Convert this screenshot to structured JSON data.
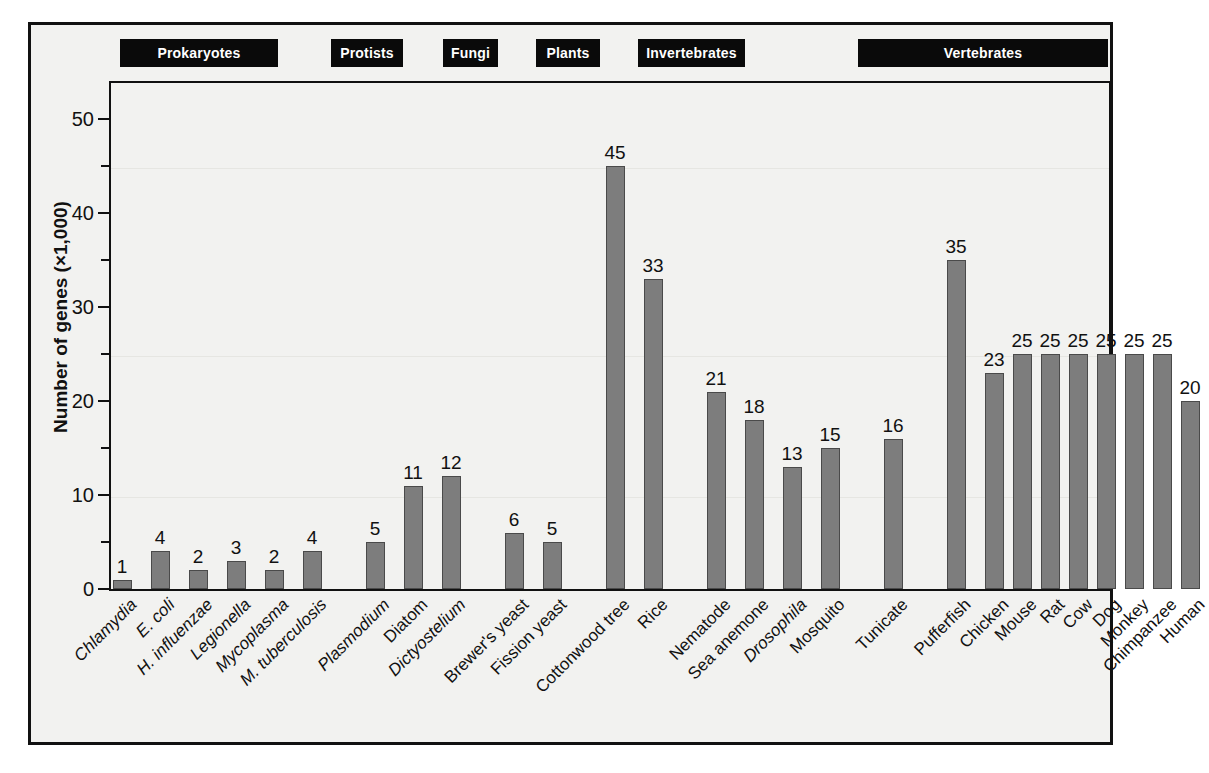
{
  "chart_data": {
    "type": "bar",
    "title": "",
    "xlabel": "",
    "ylabel": "Number of genes (×1,000)",
    "ylim": [
      0,
      55
    ],
    "yticks_major": [
      0,
      10,
      20,
      30,
      40,
      50
    ],
    "yticks_minor": [
      5,
      15,
      25,
      35,
      45
    ],
    "grid": false,
    "legend": "none",
    "groups": [
      {
        "name": "Prokaryotes",
        "categories": [
          "Chlamydia",
          "E. coli",
          "H. influenzae",
          "Legionella",
          "Mycoplasma",
          "M. tuberculosis"
        ],
        "italic": [
          true,
          true,
          true,
          true,
          true,
          true
        ],
        "values": [
          1,
          4,
          2,
          3,
          2,
          4
        ]
      },
      {
        "name": "Protists",
        "categories": [
          "Plasmodium",
          "Diatom",
          "Dictyostelium"
        ],
        "italic": [
          true,
          false,
          true
        ],
        "values": [
          5,
          11,
          12
        ]
      },
      {
        "name": "Fungi",
        "categories": [
          "Brewer's yeast",
          "Fission yeast"
        ],
        "italic": [
          false,
          false
        ],
        "values": [
          6,
          5
        ]
      },
      {
        "name": "Plants",
        "categories": [
          "Cottonwood tree",
          "Rice"
        ],
        "italic": [
          false,
          false
        ],
        "values": [
          45,
          33
        ]
      },
      {
        "name": "Invertebrates",
        "categories": [
          "Nematode",
          "Sea anemone",
          "Drosophila",
          "Mosquito"
        ],
        "italic": [
          false,
          false,
          true,
          false
        ],
        "values": [
          21,
          18,
          13,
          15
        ]
      },
      {
        "name": "",
        "categories": [
          "Tunicate"
        ],
        "italic": [
          false
        ],
        "values": [
          16
        ]
      },
      {
        "name": "Vertebrates",
        "categories": [
          "Pufferfish",
          "Chicken",
          "Mouse",
          "Rat",
          "Cow",
          "Dog",
          "Monkey",
          "Chimpanzee",
          "Human"
        ],
        "italic": [
          false,
          false,
          false,
          false,
          false,
          false,
          false,
          false,
          false
        ],
        "values": [
          35,
          23,
          25,
          25,
          25,
          25,
          25,
          25,
          20
        ]
      }
    ],
    "colors": {
      "bar_fill": "#7d7d7d",
      "bar_edge": "#4a4a4a",
      "axis": "#111111",
      "background": "#f2f2f0",
      "group_header_bg": "#0a0a0a",
      "group_header_text": "#ffffff"
    }
  },
  "group_headers": [
    {
      "label": "Prokaryotes",
      "left": 89,
      "width": 158
    },
    {
      "label": "Protists",
      "left": 300,
      "width": 72
    },
    {
      "label": "Fungi",
      "left": 412,
      "width": 55
    },
    {
      "label": "Plants",
      "left": 505,
      "width": 64
    },
    {
      "label": "Invertebrates",
      "left": 607,
      "width": 107
    },
    {
      "label": "Vertebrates",
      "left": 827,
      "width": 250
    }
  ],
  "bars": [
    {
      "label": "Chlamydia",
      "value": 1,
      "x": 11,
      "italic": true
    },
    {
      "label": "E. coli",
      "value": 4,
      "x": 49,
      "italic": true
    },
    {
      "label": "H. influenzae",
      "value": 2,
      "x": 87,
      "italic": true
    },
    {
      "label": "Legionella",
      "value": 3,
      "x": 125,
      "italic": true
    },
    {
      "label": "Mycoplasma",
      "value": 2,
      "x": 163,
      "italic": true
    },
    {
      "label": "M. tuberculosis",
      "value": 4,
      "x": 201,
      "italic": true
    },
    {
      "label": "Plasmodium",
      "value": 5,
      "x": 264,
      "italic": true
    },
    {
      "label": "Diatom",
      "value": 11,
      "x": 302,
      "italic": false
    },
    {
      "label": "Dictyostelium",
      "value": 12,
      "x": 340,
      "italic": true
    },
    {
      "label": "Brewer's yeast",
      "value": 6,
      "x": 403,
      "italic": false
    },
    {
      "label": "Fission yeast",
      "value": 5,
      "x": 441,
      "italic": false
    },
    {
      "label": "Cottonwood tree",
      "value": 45,
      "x": 504,
      "italic": false
    },
    {
      "label": "Rice",
      "value": 33,
      "x": 542,
      "italic": false
    },
    {
      "label": "Nematode",
      "value": 21,
      "x": 605,
      "italic": false
    },
    {
      "label": "Sea anemone",
      "value": 18,
      "x": 643,
      "italic": false
    },
    {
      "label": "Drosophila",
      "value": 13,
      "x": 681,
      "italic": true
    },
    {
      "label": "Mosquito",
      "value": 15,
      "x": 719,
      "italic": false
    },
    {
      "label": "Tunicate",
      "value": 16,
      "x": 782,
      "italic": false
    },
    {
      "label": "Pufferfish",
      "value": 35,
      "x": 845,
      "italic": false
    },
    {
      "label": "Chicken",
      "value": 23,
      "x": 883,
      "italic": false
    },
    {
      "label": "Mouse",
      "value": 25,
      "x": 911,
      "italic": false
    },
    {
      "label": "Rat",
      "value": 25,
      "x": 939,
      "italic": false
    },
    {
      "label": "Cow",
      "value": 25,
      "x": 967,
      "italic": false
    },
    {
      "label": "Dog",
      "value": 25,
      "x": 995,
      "italic": false
    },
    {
      "label": "Monkey",
      "value": 25,
      "x": 1023,
      "italic": false
    },
    {
      "label": "Chimpanzee",
      "value": 25,
      "x": 1051,
      "italic": false
    },
    {
      "label": "Human",
      "value": 20,
      "x": 1079,
      "italic": false
    }
  ]
}
